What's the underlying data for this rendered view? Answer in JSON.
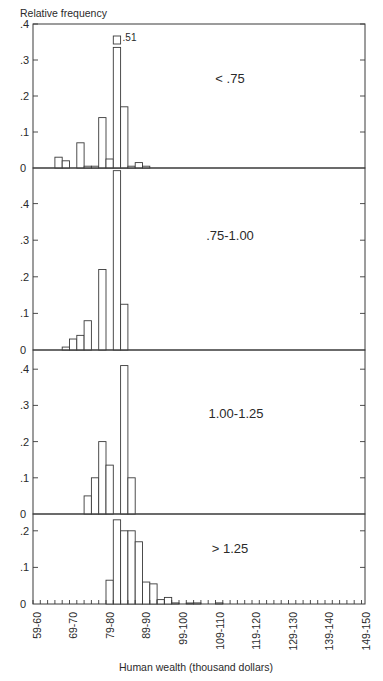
{
  "chart_data": {
    "type": "bar",
    "title": "Relative frequency",
    "ylabel": "Relative frequency",
    "xlabel": "Human wealth (thousand dollars)",
    "x_tick_labels": [
      "59-60",
      "69-70",
      "79-80",
      "89-90",
      "99-100",
      "109-110",
      "119-120",
      "129-130",
      "139-140",
      "149-150"
    ],
    "bin_width_thousand": 2,
    "bin_start": 59,
    "bin_count": 46,
    "grid": false,
    "panels": [
      {
        "label": "< .75",
        "ylim": [
          0,
          0.4
        ],
        "y_ticks": [
          "0",
          ".1",
          ".2",
          ".3",
          ".4"
        ],
        "bins": [
          {
            "x": "65-67",
            "value": 0.03
          },
          {
            "x": "67-69",
            "value": 0.02
          },
          {
            "x": "71-73",
            "value": 0.07
          },
          {
            "x": "73-75",
            "value": 0.005
          },
          {
            "x": "75-77",
            "value": 0.005
          },
          {
            "x": "77-79",
            "value": 0.14
          },
          {
            "x": "79-81",
            "value": 0.025
          },
          {
            "x": "81-83",
            "value": 0.51,
            "annotation": ".51",
            "broken": true
          },
          {
            "x": "83-85",
            "value": 0.17
          },
          {
            "x": "85-87",
            "value": 0.005
          },
          {
            "x": "87-89",
            "value": 0.015
          },
          {
            "x": "89-91",
            "value": 0.005
          }
        ]
      },
      {
        "label": ".75-1.00",
        "ylim": [
          0,
          0.5
        ],
        "y_ticks": [
          "0",
          ".1",
          ".2",
          ".3",
          ".4"
        ],
        "bins": [
          {
            "x": "67-69",
            "value": 0.008
          },
          {
            "x": "69-71",
            "value": 0.03
          },
          {
            "x": "71-73",
            "value": 0.04
          },
          {
            "x": "73-75",
            "value": 0.08
          },
          {
            "x": "77-79",
            "value": 0.22
          },
          {
            "x": "81-83",
            "value": 0.49
          },
          {
            "x": "83-85",
            "value": 0.125
          }
        ]
      },
      {
        "label": "1.00-1.25",
        "ylim": [
          0,
          0.45
        ],
        "y_ticks": [
          "0",
          ".1",
          ".2",
          ".3",
          ".4"
        ],
        "bins": [
          {
            "x": "73-75",
            "value": 0.05
          },
          {
            "x": "75-77",
            "value": 0.1
          },
          {
            "x": "77-79",
            "value": 0.2
          },
          {
            "x": "79-81",
            "value": 0.135
          },
          {
            "x": "83-85",
            "value": 0.41
          },
          {
            "x": "85-87",
            "value": 0.1
          }
        ]
      },
      {
        "label": "> 1.25",
        "ylim": [
          0,
          0.24
        ],
        "y_ticks": [
          "0",
          ".1",
          ".2"
        ],
        "bins": [
          {
            "x": "79-81",
            "value": 0.065
          },
          {
            "x": "81-83",
            "value": 0.23
          },
          {
            "x": "83-85",
            "value": 0.2
          },
          {
            "x": "85-87",
            "value": 0.2
          },
          {
            "x": "87-89",
            "value": 0.17
          },
          {
            "x": "89-91",
            "value": 0.06
          },
          {
            "x": "91-93",
            "value": 0.055
          },
          {
            "x": "93-95",
            "value": 0.012
          },
          {
            "x": "95-97",
            "value": 0.018
          },
          {
            "x": "97-99",
            "value": 0.003
          },
          {
            "x": "101-103",
            "value": 0.002
          },
          {
            "x": "103-105",
            "value": 0.003
          },
          {
            "x": "109-111",
            "value": 0.003
          }
        ]
      }
    ]
  },
  "layout": {
    "plot_left": 33,
    "plot_right": 365,
    "bin_px": 7.3,
    "label_x0": 36.5,
    "label_step": 36.6,
    "panels_px": [
      {
        "top": 24,
        "base": 168,
        "px_per_unit": 360
      },
      {
        "top": 168,
        "base": 350,
        "px_per_unit": 366
      },
      {
        "top": 350,
        "base": 514,
        "px_per_unit": 362
      },
      {
        "top": 514,
        "base": 604,
        "px_per_unit": 366
      }
    ],
    "panel_label_pos": [
      [
        230,
        83
      ],
      [
        230,
        240
      ],
      [
        236,
        418
      ],
      [
        230,
        553
      ]
    ]
  }
}
